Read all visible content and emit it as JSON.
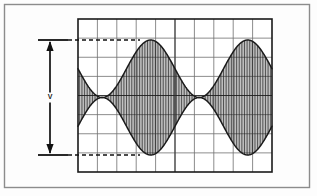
{
  "figure": {
    "outer_border": {
      "x": 4,
      "y": 4,
      "width": 306,
      "height": 184,
      "color": "#8c8c8c"
    },
    "background_color": "#fdfdfd"
  },
  "graticule": {
    "name": "oscilloscope-graticule",
    "x": 78,
    "y": 19,
    "width": 194,
    "height": 153,
    "divisions_horizontal": 10,
    "divisions_vertical": 8,
    "grid_line_color": "#6e6e6e",
    "border_color": "#1a1a1a",
    "center_line_color": "#3a3a3a"
  },
  "amplitude_marker": {
    "name": "peak-to-peak-amplitude-marker",
    "label": "V",
    "arrow_x": 50,
    "top_y": 40,
    "bottom_y": 155,
    "tick_left_x": 38,
    "tick_right_x": 68,
    "color": "#111111"
  },
  "reference_lines": {
    "top_dashed": {
      "label": "positive peak envelope reference",
      "y": 40,
      "x_start": 68,
      "x_end": 140
    },
    "bottom_dashed": {
      "label": "negative peak envelope reference",
      "y": 155,
      "x_start": 68,
      "x_end": 140
    },
    "dash_color": "#111111"
  },
  "chart_data": {
    "type": "line",
    "subtitle": "100% modulation depth, two modulation cycles displayed",
    "xlabel": "",
    "ylabel": "",
    "xlim": [
      0,
      2
    ],
    "ylim": [
      -1,
      1
    ],
    "grid": true,
    "legend_position": "none",
    "annotations": [
      {
        "text": "V",
        "meaning": "peak-to-peak amplitude",
        "x": 50,
        "y": 97
      }
    ],
    "parameters": {
      "modulation_index": 1.0,
      "modulation_cycles": 2,
      "carrier_cycles": 60,
      "envelope_peak_normalized": 1.0,
      "envelope_trough_normalized": 0.0,
      "envelope_peak_pixel_y": 40,
      "envelope_trough_pixel_y": 155,
      "zero_axis_pixel_y": 97.5
    },
    "series": [
      {
        "name": "carrier",
        "description": "dense vertical carrier trace filling envelope",
        "color": "#1a1a1a"
      },
      {
        "name": "upper-envelope",
        "description": "positive modulation envelope, cosine shape",
        "color": "#1a1a1a"
      },
      {
        "name": "lower-envelope",
        "description": "negative modulation envelope, mirrored cosine",
        "color": "#1a1a1a"
      }
    ],
    "x": [
      0.0,
      0.125,
      0.25,
      0.375,
      0.5,
      0.625,
      0.75,
      0.875,
      1.0,
      1.125,
      1.25,
      1.375,
      1.5,
      1.625,
      1.75,
      1.875,
      2.0
    ],
    "upper_envelope": [
      0.5,
      0.146,
      0.0,
      0.146,
      0.5,
      0.854,
      1.0,
      0.854,
      0.5,
      0.146,
      0.0,
      0.146,
      0.5,
      0.854,
      1.0,
      0.854,
      0.5
    ],
    "lower_envelope": [
      -0.5,
      -0.146,
      0.0,
      -0.146,
      -0.5,
      -0.854,
      -1.0,
      -0.854,
      -0.5,
      -0.146,
      0.0,
      -0.146,
      -0.5,
      -0.854,
      -1.0,
      -0.854,
      -0.5
    ]
  }
}
